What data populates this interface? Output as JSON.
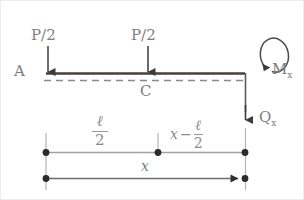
{
  "figure": {
    "type": "free-body-diagram",
    "colors": {
      "beam": "#4a4039",
      "dashed_axis": "#7a7a7a",
      "dimension_line": "#8f8f8f",
      "arrow": "#3b3b3b",
      "text": "#7d7d7d",
      "background": "#ffffff",
      "border": "#e8e8e8"
    },
    "labels": {
      "load_left": "P/2",
      "load_right": "P/2",
      "support_point": "A",
      "midpoint": "C",
      "moment": "M",
      "moment_subscript": "x",
      "shear": "Q",
      "shear_subscript": "x"
    },
    "dimensions": {
      "half_span": {
        "numerator": "ℓ",
        "denominator": "2"
      },
      "remainder": {
        "lead": "x",
        "operator": "−",
        "numerator": "ℓ",
        "denominator": "2"
      },
      "total": "x"
    }
  }
}
